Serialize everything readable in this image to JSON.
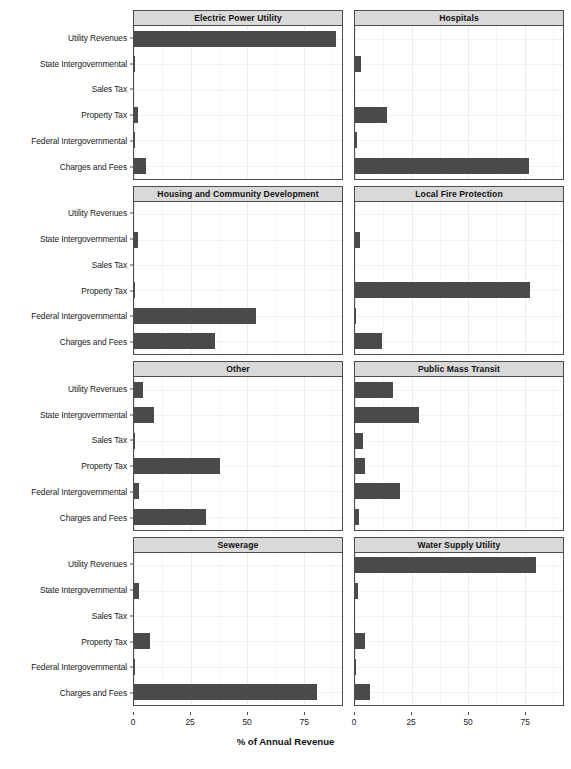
{
  "chart_data": {
    "type": "bar",
    "orientation": "horizontal",
    "title": "",
    "xlabel": "% of Annual Revenue",
    "ylabel": "",
    "xlim": [
      0,
      92
    ],
    "xticks": [
      0,
      25,
      50,
      75
    ],
    "xticklabels": [
      "0",
      "25",
      "50",
      "75"
    ],
    "grid": true,
    "legend": "none",
    "facet_layout": {
      "rows": 4,
      "cols": 2
    },
    "categories": [
      "Utility Revenues",
      "State Intergovernmental",
      "Sales Tax",
      "Property Tax",
      "Federal Intergovernmental",
      "Charges and Fees"
    ],
    "panels": [
      {
        "title": "Electric Power Utility",
        "values": [
          89.5,
          0.4,
          0.0,
          1.7,
          0.3,
          5.3
        ]
      },
      {
        "title": "Hospitals",
        "values": [
          0.0,
          2.6,
          0.0,
          14.0,
          0.7,
          77.0
        ]
      },
      {
        "title": "Housing and Community Development",
        "values": [
          0.0,
          1.6,
          0.0,
          0.4,
          54.0,
          36.0
        ]
      },
      {
        "title": "Local Fire Protection",
        "values": [
          0.0,
          2.4,
          0.0,
          77.5,
          0.6,
          12.0
        ]
      },
      {
        "title": "Other",
        "values": [
          4.2,
          9.0,
          0.3,
          38.0,
          2.2,
          32.0
        ]
      },
      {
        "title": "Public Mass Transit",
        "values": [
          17.0,
          28.5,
          3.6,
          4.6,
          20.0,
          1.6
        ]
      },
      {
        "title": "Sewerage",
        "values": [
          0.0,
          2.2,
          0.0,
          7.2,
          0.5,
          81.0
        ]
      },
      {
        "title": "Water Supply Utility",
        "values": [
          80.0,
          1.2,
          0.0,
          4.4,
          0.6,
          6.6
        ]
      }
    ],
    "colors": {
      "bar": "#4a4a4a",
      "panel_background": "#ffffff",
      "strip_background": "#d9d9d9",
      "gridline": "#ebebeb",
      "border": "#4d4d4d",
      "text": "#1a1a1a"
    }
  }
}
